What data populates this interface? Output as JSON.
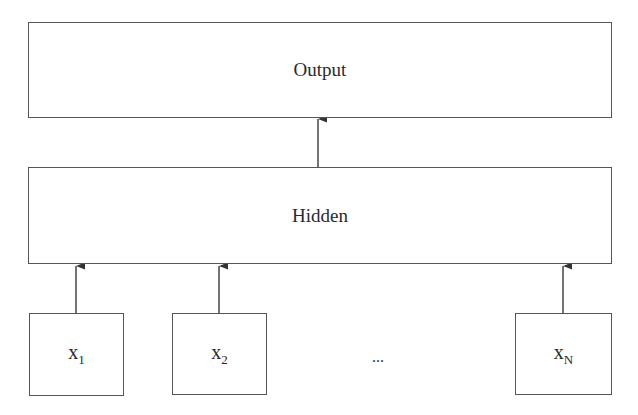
{
  "diagram": {
    "type": "neural-network-architecture",
    "layers": {
      "output": {
        "label": "Output"
      },
      "hidden": {
        "label": "Hidden"
      },
      "inputs": [
        {
          "base": "x",
          "subscript": "1"
        },
        {
          "base": "x",
          "subscript": "2"
        },
        {
          "base": "x",
          "subscript": "N"
        }
      ],
      "ellipsis": "..."
    },
    "edges": [
      {
        "from": "x1",
        "to": "Hidden"
      },
      {
        "from": "x2",
        "to": "Hidden"
      },
      {
        "from": "xN",
        "to": "Hidden"
      },
      {
        "from": "Hidden",
        "to": "Output"
      }
    ],
    "colors": {
      "stroke": "#555555",
      "text": "#2a2a2a",
      "background": "#ffffff"
    }
  }
}
